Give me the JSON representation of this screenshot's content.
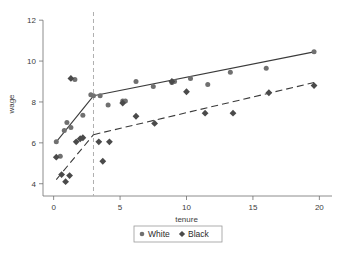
{
  "chart_data": {
    "type": "scatter",
    "title": "",
    "xlabel": "tenure",
    "ylabel": "wage",
    "xlim": [
      -0.8,
      20.8
    ],
    "ylim": [
      3.4,
      12.4
    ],
    "xticks": [
      0,
      5,
      10,
      15,
      20
    ],
    "yticks": [
      4,
      6,
      8,
      10,
      12
    ],
    "xtick_labels": [
      "0",
      "5",
      "10",
      "15",
      "20"
    ],
    "ytick_labels": [
      "4",
      "6",
      "8",
      "10",
      "12"
    ],
    "grid": false,
    "legend_position": "below-center",
    "annotations": {
      "cutoff_x": 3,
      "cutoff_style": "vertical dashed gray line"
    },
    "series": [
      {
        "name": "White",
        "marker": "circle",
        "color": "#707070",
        "fit_line_style": "solid",
        "points": [
          {
            "x": 0.2,
            "y": 6.05
          },
          {
            "x": 0.5,
            "y": 5.35
          },
          {
            "x": 0.8,
            "y": 6.6
          },
          {
            "x": 1.0,
            "y": 7.0
          },
          {
            "x": 1.3,
            "y": 6.75
          },
          {
            "x": 1.6,
            "y": 9.1
          },
          {
            "x": 2.2,
            "y": 7.35
          },
          {
            "x": 2.8,
            "y": 8.35
          },
          {
            "x": 3.0,
            "y": 8.3
          },
          {
            "x": 3.5,
            "y": 8.3
          },
          {
            "x": 4.1,
            "y": 7.85
          },
          {
            "x": 5.2,
            "y": 8.05
          },
          {
            "x": 5.4,
            "y": 8.05
          },
          {
            "x": 6.2,
            "y": 9.0
          },
          {
            "x": 7.5,
            "y": 8.75
          },
          {
            "x": 8.9,
            "y": 8.95
          },
          {
            "x": 9.1,
            "y": 9.0
          },
          {
            "x": 10.3,
            "y": 9.15
          },
          {
            "x": 11.6,
            "y": 8.85
          },
          {
            "x": 13.3,
            "y": 9.45
          },
          {
            "x": 16.0,
            "y": 9.65
          },
          {
            "x": 19.6,
            "y": 10.45
          }
        ],
        "fit_segments": [
          {
            "from": [
              0.2,
              6.05
            ],
            "to": [
              3.0,
              8.3
            ]
          },
          {
            "from": [
              3.0,
              8.3
            ],
            "to": [
              19.6,
              10.45
            ]
          }
        ]
      },
      {
        "name": "Black",
        "marker": "diamond",
        "color": "#4a4a4a",
        "fit_line_style": "dashed",
        "points": [
          {
            "x": 0.2,
            "y": 5.3
          },
          {
            "x": 0.6,
            "y": 4.45
          },
          {
            "x": 0.9,
            "y": 4.1
          },
          {
            "x": 1.2,
            "y": 4.4
          },
          {
            "x": 1.3,
            "y": 9.15
          },
          {
            "x": 1.7,
            "y": 6.05
          },
          {
            "x": 2.0,
            "y": 6.2
          },
          {
            "x": 2.2,
            "y": 6.25
          },
          {
            "x": 3.4,
            "y": 6.05
          },
          {
            "x": 3.7,
            "y": 5.1
          },
          {
            "x": 4.2,
            "y": 6.05
          },
          {
            "x": 5.2,
            "y": 7.95
          },
          {
            "x": 6.2,
            "y": 7.3
          },
          {
            "x": 7.6,
            "y": 6.95
          },
          {
            "x": 8.9,
            "y": 9.0
          },
          {
            "x": 10.0,
            "y": 8.5
          },
          {
            "x": 11.4,
            "y": 7.45
          },
          {
            "x": 13.5,
            "y": 7.45
          },
          {
            "x": 16.2,
            "y": 8.45
          },
          {
            "x": 19.6,
            "y": 8.8
          }
        ],
        "fit_segments": [
          {
            "from": [
              0.2,
              4.2
            ],
            "to": [
              3.0,
              6.4
            ]
          },
          {
            "from": [
              3.0,
              6.4
            ],
            "to": [
              19.6,
              8.95
            ]
          }
        ]
      }
    ],
    "legend": [
      {
        "label": "White",
        "marker": "circle",
        "color": "#707070"
      },
      {
        "label": "Black",
        "marker": "diamond",
        "color": "#4a4a4a"
      }
    ]
  }
}
